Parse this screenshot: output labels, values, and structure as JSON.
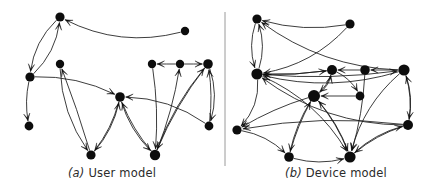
{
  "figure": {
    "width": 448,
    "height": 191,
    "background": "#ffffff",
    "node_color": "#0d0d0d",
    "edge_color": "#1a1a1a",
    "divider_color": "#9a9a9a",
    "caption_color": "#2b2b2b"
  },
  "divider": {
    "x": 225,
    "y1": 12,
    "y2": 166
  },
  "panels": [
    {
      "id": "a",
      "caption_tag": "(a)",
      "caption_text": "User model",
      "caption": "(a) User model",
      "node_radius": 4.2,
      "nodes": [
        {
          "id": "n0",
          "x": 60,
          "y": 17,
          "r": 4.6
        },
        {
          "id": "n1",
          "x": 30,
          "y": 77,
          "r": 4.6
        },
        {
          "id": "n2",
          "x": 29,
          "y": 126,
          "r": 4.4
        },
        {
          "id": "n3",
          "x": 60,
          "y": 64,
          "r": 4.2
        },
        {
          "id": "n4",
          "x": 120,
          "y": 97,
          "r": 4.8
        },
        {
          "id": "n5",
          "x": 91,
          "y": 155,
          "r": 4.6
        },
        {
          "id": "n6",
          "x": 152,
          "y": 64,
          "r": 4.2
        },
        {
          "id": "n7",
          "x": 180,
          "y": 64,
          "r": 4.2
        },
        {
          "id": "n8",
          "x": 208,
          "y": 64,
          "r": 4.8
        },
        {
          "id": "n9",
          "x": 185,
          "y": 31,
          "r": 4.2
        },
        {
          "id": "n10",
          "x": 209,
          "y": 126,
          "r": 4.4
        },
        {
          "id": "n11",
          "x": 155,
          "y": 155,
          "r": 5.2
        }
      ],
      "edges": [
        {
          "from": "n9",
          "to": "n0",
          "curve": -26
        },
        {
          "from": "n0",
          "to": "n1",
          "curve": 14
        },
        {
          "from": "n1",
          "to": "n0",
          "curve": 14
        },
        {
          "from": "n1",
          "to": "n2",
          "curve": 6
        },
        {
          "from": "n1",
          "to": "n4",
          "curve": -13
        },
        {
          "from": "n3",
          "to": "n5",
          "curve": 16
        },
        {
          "from": "n5",
          "to": "n3",
          "curve": 2
        },
        {
          "from": "n5",
          "to": "n4",
          "curve": 10
        },
        {
          "from": "n4",
          "to": "n5",
          "curve": -8
        },
        {
          "from": "n4",
          "to": "n11",
          "curve": 10
        },
        {
          "from": "n11",
          "to": "n4",
          "curve": -7
        },
        {
          "from": "n10",
          "to": "n4",
          "curve": 16
        },
        {
          "from": "n7",
          "to": "n6",
          "curve": 0
        },
        {
          "from": "n7",
          "to": "n8",
          "curve": 0
        },
        {
          "from": "n6",
          "to": "n11",
          "curve": -6
        },
        {
          "from": "n11",
          "to": "n7",
          "curve": 6
        },
        {
          "from": "n10",
          "to": "n8",
          "curve": 5
        },
        {
          "from": "n8",
          "to": "n11",
          "curve": 8
        },
        {
          "from": "n11",
          "to": "n8",
          "curve": -10
        },
        {
          "from": "n8",
          "to": "n10",
          "curve": -12
        }
      ]
    },
    {
      "id": "b",
      "caption_tag": "(b)",
      "caption_text": "Device model",
      "caption": "(b) Device model",
      "node_radius": 4.4,
      "nodes": [
        {
          "id": "m0",
          "x": 33,
          "y": 19,
          "r": 4.6
        },
        {
          "id": "m1",
          "x": 33,
          "y": 74,
          "r": 5.6
        },
        {
          "id": "m2",
          "x": 126,
          "y": 24,
          "r": 4.6
        },
        {
          "id": "m3",
          "x": 108,
          "y": 70,
          "r": 5.0
        },
        {
          "id": "m4",
          "x": 141,
          "y": 70,
          "r": 4.8
        },
        {
          "id": "m5",
          "x": 180,
          "y": 70,
          "r": 5.6
        },
        {
          "id": "m6",
          "x": 136,
          "y": 96,
          "r": 4.4
        },
        {
          "id": "m7",
          "x": 90,
          "y": 96,
          "r": 6.0
        },
        {
          "id": "m8",
          "x": 13,
          "y": 130,
          "r": 4.6
        },
        {
          "id": "m9",
          "x": 184,
          "y": 125,
          "r": 5.0
        },
        {
          "id": "m10",
          "x": 65,
          "y": 157,
          "r": 4.8
        },
        {
          "id": "m11",
          "x": 126,
          "y": 157,
          "r": 5.6
        }
      ],
      "edges": [
        {
          "from": "m2",
          "to": "m0",
          "curve": -12
        },
        {
          "from": "m0",
          "to": "m1",
          "curve": 11
        },
        {
          "from": "m1",
          "to": "m0",
          "curve": 11
        },
        {
          "from": "m2",
          "to": "m1",
          "curve": -20
        },
        {
          "from": "m5",
          "to": "m1",
          "curve": -22
        },
        {
          "from": "m5",
          "to": "m0",
          "curve": -26
        },
        {
          "from": "m9",
          "to": "m1",
          "curve": -28
        },
        {
          "from": "m1",
          "to": "m3",
          "curve": 4
        },
        {
          "from": "m3",
          "to": "m1",
          "curve": -4
        },
        {
          "from": "m4",
          "to": "m3",
          "curve": 0
        },
        {
          "from": "m5",
          "to": "m4",
          "curve": 0
        },
        {
          "from": "m1",
          "to": "m5",
          "curve": 9
        },
        {
          "from": "m3",
          "to": "m6",
          "curve": -8
        },
        {
          "from": "m7",
          "to": "m3",
          "curve": 9
        },
        {
          "from": "m3",
          "to": "m7",
          "curve": -7
        },
        {
          "from": "m4",
          "to": "m11",
          "curve": -6
        },
        {
          "from": "m5",
          "to": "m9",
          "curve": -8
        },
        {
          "from": "m9",
          "to": "m5",
          "curve": 9
        },
        {
          "from": "m1",
          "to": "m8",
          "curve": -16
        },
        {
          "from": "m7",
          "to": "m8",
          "curve": 6
        },
        {
          "from": "m9",
          "to": "m8",
          "curve": 14
        },
        {
          "from": "m8",
          "to": "m10",
          "curve": -11
        },
        {
          "from": "m7",
          "to": "m10",
          "curve": 7
        },
        {
          "from": "m10",
          "to": "m7",
          "curve": -5
        },
        {
          "from": "m7",
          "to": "m11",
          "curve": -7
        },
        {
          "from": "m11",
          "to": "m7",
          "curve": 8
        },
        {
          "from": "m10",
          "to": "m11",
          "curve": 10
        },
        {
          "from": "m9",
          "to": "m11",
          "curve": 8
        },
        {
          "from": "m11",
          "to": "m9",
          "curve": -10
        },
        {
          "from": "m5",
          "to": "m11",
          "curve": 18
        },
        {
          "from": "m1",
          "to": "m11",
          "curve": -22
        },
        {
          "from": "m6",
          "to": "m7",
          "curve": 0
        }
      ]
    }
  ]
}
